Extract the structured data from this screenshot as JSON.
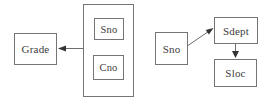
{
  "colors": {
    "background": "#ffffff",
    "box_border": "#757575",
    "edge_line": "#6e6e6e",
    "arrowhead": "#333333",
    "text": "#3b3b3b"
  },
  "left_diagram": {
    "grade_label": "Grade",
    "composite_members": {
      "sno": "Sno",
      "cno": "Cno"
    }
  },
  "right_diagram": {
    "sno_label": "Sno",
    "sdept_label": "Sdept",
    "sloc_label": "Sloc"
  },
  "edges": [
    {
      "from": "Sno+Cno composite",
      "to": "Grade",
      "direction": "left"
    },
    {
      "from": "Sno",
      "to": "Sdept",
      "direction": "up-right"
    },
    {
      "from": "Sdept",
      "to": "Sloc",
      "direction": "down"
    }
  ]
}
